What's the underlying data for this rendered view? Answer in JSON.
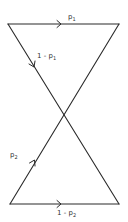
{
  "diagram": {
    "edges": {
      "top": {
        "label_main": "p",
        "label_sub": "1"
      },
      "top_diagonal": {
        "label_main": "1 - p",
        "label_sub": "1"
      },
      "bottom_diagonal": {
        "label_main": "p",
        "label_sub": "2"
      },
      "bottom": {
        "label_main": "1 - p",
        "label_sub": "2"
      }
    },
    "colors": {
      "line": "#2a2a2a",
      "text": "#333333",
      "background": "#ffffff"
    }
  }
}
